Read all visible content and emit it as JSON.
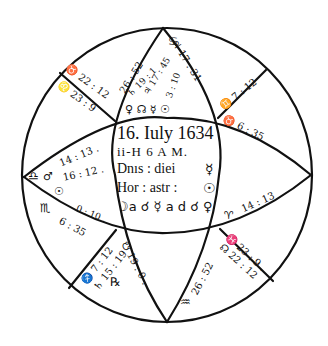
{
  "figure": {
    "stroke_color": "#111111",
    "background": "#ffffff"
  },
  "center": {
    "line1": "16. Iuly 1634",
    "line2": "ii-H 6 A M.",
    "line3_label": "Dnıs : diei",
    "line3_symbol": "☿",
    "line4_label": "Hor : astr :",
    "line4_symbol": "☉",
    "line5": "☽a ☌ ☿ a d ☌ ♀"
  },
  "cusps": {
    "top_left_outer": "♉ 22 : 12",
    "top_left_inner": "♌ 23 : 9",
    "top_left_sign": "♌",
    "top_apex_sign": "♋",
    "top_left_edge": "26 : 52",
    "top_right_edge": "♃ 17 : 31",
    "top_right_inner": "♋ 9.",
    "upper_right_outer": "♊ 7 : 12",
    "upper_right_inner": "♉ 6 : 35",
    "left_upper": "14 : 13 .",
    "left_upper2": "16 : 12 .",
    "left_sign": "♎",
    "left_planet": "♂",
    "left_planet2": "☉",
    "left_lower_sign": "♏",
    "left_lower_val": "0 : 10 .",
    "left_lower_val2": "6 : 35",
    "right_lower_sign": "♈",
    "right_lower_val": "14 : 13",
    "lower_right_outer": "♓ 23 : 9 .",
    "lower_right_inner": "☊ 22 : 12",
    "bottom_right_edge": "26 : 52",
    "bottom_sign": "♒",
    "lower_left_outer": "♐ 7 : 12",
    "lower_left_inner": "♄ 15 : 19",
    "lower_left_symbol": "℞",
    "bottom_left_edge": "☋ 19 : 0 ."
  },
  "top_planets": {
    "labels": [
      "♃ 17 : 45",
      "♄ 19 : 1",
      "3 : 10",
      "♀☊☿☉"
    ],
    "row": "♀ ☊ ☿ ☉"
  }
}
